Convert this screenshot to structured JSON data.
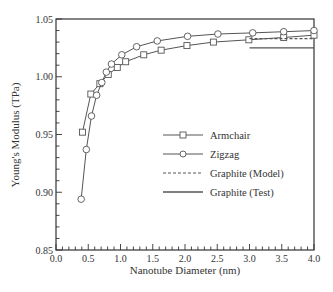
{
  "chart_data": {
    "type": "line",
    "title": "",
    "xlabel": "Nanotube Diameter (nm)",
    "ylabel": "Young's Modulus (TPa)",
    "xlim": [
      0.0,
      4.0
    ],
    "ylim": [
      0.85,
      1.05
    ],
    "xticks": [
      "0.0",
      "0.5",
      "1.0",
      "1.5",
      "2.0",
      "2.5",
      "3.0",
      "3.5",
      "4.0"
    ],
    "yticks": [
      "0.85",
      "0.90",
      "0.95",
      "1.00",
      "1.05"
    ],
    "grid": false,
    "legend_position": "center-right",
    "series": [
      {
        "name": "Armchair",
        "marker": "square",
        "linestyle": "solid",
        "x": [
          0.41,
          0.54,
          0.68,
          0.81,
          0.95,
          1.08,
          1.36,
          1.63,
          2.03,
          2.44,
          2.99,
          3.53,
          4.07
        ],
        "y": [
          0.952,
          0.985,
          0.994,
          1.002,
          1.008,
          1.013,
          1.019,
          1.023,
          1.027,
          1.03,
          1.032,
          1.034,
          1.036
        ]
      },
      {
        "name": "Zigzag",
        "marker": "circle",
        "linestyle": "solid",
        "x": [
          0.39,
          0.47,
          0.55,
          0.63,
          0.71,
          0.78,
          0.86,
          1.02,
          1.25,
          1.57,
          2.04,
          2.51,
          3.05,
          3.53,
          4.0
        ],
        "y": [
          0.894,
          0.937,
          0.966,
          0.984,
          0.995,
          1.004,
          1.011,
          1.019,
          1.026,
          1.031,
          1.035,
          1.037,
          1.038,
          1.039,
          1.04
        ]
      },
      {
        "name": "Graphite (Model)",
        "marker": "none",
        "linestyle": "dashed",
        "x": [
          3.0,
          4.0
        ],
        "y": [
          1.033,
          1.033
        ]
      },
      {
        "name": "Graphite (Test)",
        "marker": "none",
        "linestyle": "solid",
        "x": [
          3.0,
          4.0
        ],
        "y": [
          1.025,
          1.025
        ]
      }
    ]
  },
  "axes": {
    "xlabel": "Nanotube Diameter (nm)",
    "ylabel": "Young's Modulus (TPa)"
  },
  "legend": {
    "items": [
      {
        "label": "Armchair"
      },
      {
        "label": "Zigzag"
      },
      {
        "label": "Graphite (Model)"
      },
      {
        "label": "Graphite (Test)"
      }
    ]
  },
  "colors": {
    "line": "#555555",
    "axis": "#333333",
    "text": "#333333",
    "marker_fill": "#ffffff"
  }
}
